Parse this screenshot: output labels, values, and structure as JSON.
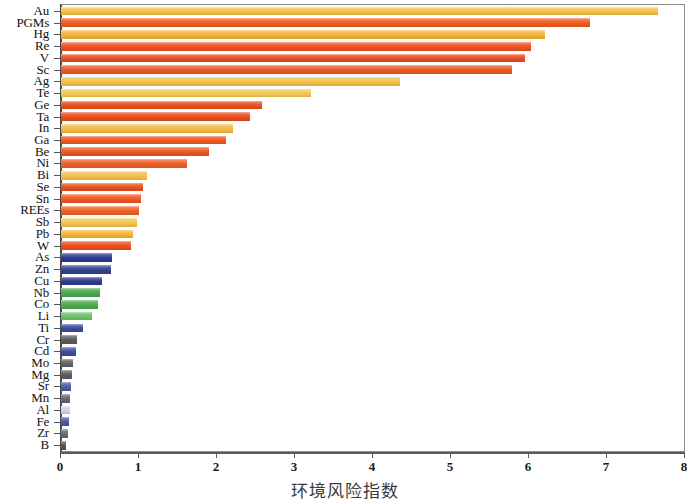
{
  "chart_data": {
    "type": "bar",
    "orientation": "horizontal",
    "title": "",
    "xlabel": "环境风险指数",
    "ylabel": "",
    "xlim": [
      0,
      8
    ],
    "ylim": null,
    "grid": false,
    "legend": null,
    "xticks": [
      "0",
      "1",
      "2",
      "3",
      "4",
      "5",
      "6",
      "7",
      "8"
    ],
    "categories": [
      "Au",
      "PGMs",
      "Hg",
      "Re",
      "V",
      "Sc",
      "Ag",
      "Te",
      "Ge",
      "Ta",
      "In",
      "Ga",
      "Be",
      "Ni",
      "Bi",
      "Se",
      "Sn",
      "REEs",
      "Sb",
      "Pb",
      "W",
      "As",
      "Zn",
      "Cu",
      "Nb",
      "Co",
      "Li",
      "Ti",
      "Cr",
      "Cd",
      "Mo",
      "Mg",
      "Sr",
      "Mn",
      "Al",
      "Fe",
      "Zr",
      "B"
    ],
    "values": [
      7.65,
      6.78,
      6.2,
      6.02,
      5.95,
      5.78,
      4.35,
      3.2,
      2.58,
      2.42,
      2.2,
      2.12,
      1.9,
      1.62,
      1.1,
      1.05,
      1.02,
      1.0,
      0.98,
      0.92,
      0.9,
      0.66,
      0.64,
      0.52,
      0.5,
      0.47,
      0.4,
      0.28,
      0.2,
      0.19,
      0.15,
      0.14,
      0.13,
      0.12,
      0.11,
      0.1,
      0.09,
      0.07
    ],
    "colors": [
      "#f5c246",
      "#ef5a20",
      "#f2b33c",
      "#ee5121",
      "#e94e1f",
      "#ed5a22",
      "#f3bf45",
      "#f4c651",
      "#ea4f1e",
      "#e94d1d",
      "#f2bb42",
      "#ee5824",
      "#ec5520",
      "#ef5f26",
      "#f3c04b",
      "#ea4f1f",
      "#ee5822",
      "#ef5f27",
      "#f3c451",
      "#f5b531",
      "#ef4f1c",
      "#2c3b8f",
      "#33418f",
      "#2f3c8c",
      "#4aa84a",
      "#4cab4c",
      "#6cc16c",
      "#3b4b9b",
      "#5a5a5a",
      "#3d4d9e",
      "#636363",
      "#5e5e5e",
      "#4a5aa8",
      "#676767",
      "#c9d4ee",
      "#4a5aa8",
      "#6b6b6b",
      "#555555"
    ],
    "bar_color_groups": {
      "high_risk_orange": "#ee5521",
      "high_risk_yellow": "#f3bf45",
      "blue": "#2f3c8c",
      "green": "#4aa84a",
      "gray": "#5e5e5e"
    }
  },
  "axis": {
    "x_title": "环境风险指数",
    "x_tick_labels": [
      "0",
      "1",
      "2",
      "3",
      "4",
      "5",
      "6",
      "7",
      "8"
    ]
  }
}
